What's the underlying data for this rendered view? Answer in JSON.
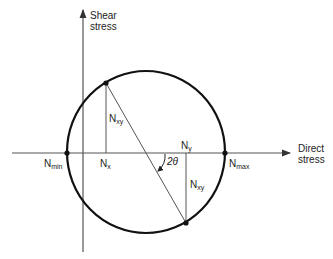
{
  "diagram": {
    "axes": {
      "vertical": {
        "label_line1": "Shear",
        "label_line2": "stress"
      },
      "horizontal": {
        "label_line1": "Direct",
        "label_line2": "stress"
      }
    },
    "labels": {
      "n_min": {
        "main": "N",
        "sub": "min"
      },
      "n_max": {
        "main": "N",
        "sub": "max"
      },
      "n_x": {
        "main": "N",
        "sub": "x"
      },
      "n_y": {
        "main": "N",
        "sub": "y"
      },
      "n_xy_top": {
        "main": "N",
        "sub": "xy"
      },
      "n_xy_bottom": {
        "main": "N",
        "sub": "xy"
      },
      "angle": "2θ"
    },
    "colors": {
      "circle": "#111111",
      "axes": "#555555",
      "lines": "#555555"
    }
  }
}
